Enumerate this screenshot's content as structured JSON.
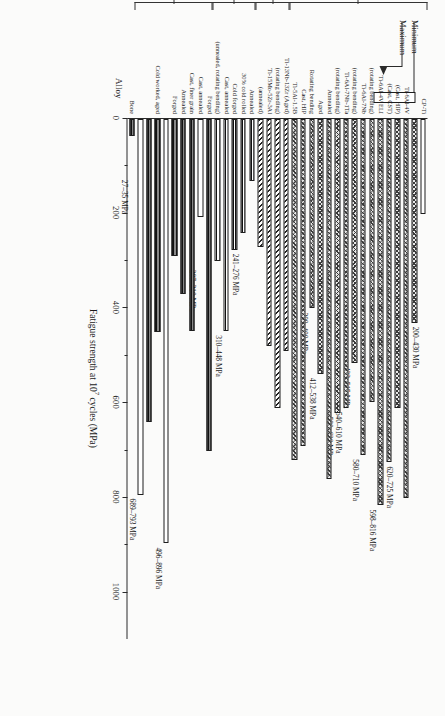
{
  "figure": {
    "axis_title_x": "Fatigue strength at 10",
    "axis_title_x_sup": "7",
    "axis_title_x_tail": " cycles (MPa)",
    "axis_title_y": "Alloy",
    "x_ticks": [
      "0",
      "200",
      "400",
      "600",
      "800",
      "1000"
    ],
    "xlim_max": 1100
  },
  "legend": {
    "minimum_label": "Minimum",
    "maximum_label": "Maximum"
  },
  "families": [
    {
      "label": "α + β",
      "first": 0,
      "last": 13
    },
    {
      "label": "β",
      "first": 14,
      "last": 17
    },
    {
      "label": "Stainless steel",
      "first": 18,
      "last": 22
    },
    {
      "label": "Co type alloy",
      "first": 23,
      "last": 28
    }
  ],
  "chart_data": {
    "type": "bar",
    "xlabel": "Fatigue strength at 10^7 cycles (MPa)",
    "ylabel": "Alloy",
    "xlim": [
      0,
      1100
    ],
    "grid": false,
    "legend": [
      "Minimum",
      "Maximum"
    ],
    "note": "Each alloy shows a Minimum bar (open/white) and a Maximum bar (hatched); single bars where only one value is reported.",
    "categories": [
      "CP-Ti",
      "Ti-6Al-4V",
      "(Cast, HIP)",
      "(Cast, CST)",
      "Ti-6Al-4V ELI",
      "(rotating bending)",
      "Ti-6Al-7Nb",
      "(rotating bending)",
      "Ti-6Al-7Nb-1Ta",
      "(rotating bending)",
      "Annealed",
      "Aged",
      "Rotating bending",
      "Cast, HIP",
      "Ti-5Al-1.5B",
      "Ti-13Nb-13Zr (Aged)",
      "TMZF(Ti-12Mo-6Zr-2Fe) (annealed, rotating bending)",
      "Ti-15Mo-5Zr-3Al",
      "Ti-35.3Nb-5.1Ta-7.1Zr (annealed)",
      "Annealed",
      "30% cold rolled",
      "Cold forged",
      "Cast, annealed",
      "(unnealed, rotating bending)",
      "Forged",
      "Cast, annealed",
      "Cast, finer grain",
      "Annealed",
      "Forged",
      "Cold worked, aged",
      "Bone"
    ],
    "series": [
      {
        "name": "Minimum",
        "values": [
          200,
          620,
          650,
          320,
          598,
          423,
          580,
          540,
          580,
          560,
          412,
          300,
          640,
          null,
          620,
          430,
          480,
          265,
          210,
          80,
          241,
          310,
          200,
          680,
          null,
          207,
          450,
          330,
          290,
          450,
          27
        ]
      },
      {
        "name": "Maximum",
        "values": [
          430,
          725,
          null,
          null,
          816,
          515,
          710,
          610,
          620,
          null,
          538,
          400,
          null,
          null,
          null,
          null,
          null,
          null,
          null,
          null,
          276,
          448,
          null,
          null,
          null,
          310,
          null,
          null,
          null,
          689,
          35
        ]
      }
    ],
    "annotations": [
      {
        "bar": "CP-Ti",
        "text": "200–430 MPa"
      },
      {
        "bar": "Ti-6Al-4V",
        "text": "620–725 MPa"
      },
      {
        "bar": "Ti-6Al-4V ELI",
        "text": "598–816 MPa"
      },
      {
        "bar": "Ti-6Al-7Nb",
        "text": "580–710 MPa"
      },
      {
        "bar": "Ti-6Al-4V (rotating bending)",
        "text": "423–515 MPa"
      },
      {
        "bar": "Ti-6Al-7Nb (rotating bending)",
        "text": "540–610 MPa"
      },
      {
        "bar": "Ti-6Al-7Nb-1Ta",
        "text": "580–620 MPa"
      },
      {
        "bar": "Annealed",
        "text": "412–538 MPa"
      },
      {
        "bar": "Aged",
        "text": "300–400 MPa"
      },
      {
        "bar": "AISI 316 LVM",
        "text": "241–276 MPa"
      },
      {
        "bar": "SUS 316 L",
        "text": "310–448 MPa"
      },
      {
        "bar": "Co-Cr-Mo forged",
        "text": "207–310 MPa"
      },
      {
        "bar": "Co-Cr-Mo cast annealed",
        "text": "496–896 MPa"
      },
      {
        "bar": "Co-Ni-Cr-Mo cold worked aged",
        "text": "689–793 MPa"
      },
      {
        "bar": "Bone",
        "text": "27–35 MPa"
      }
    ]
  },
  "bars": [
    {
      "name": "cp-ti-min",
      "label": "CP-Ti",
      "v": 200,
      "hatch": "h-open",
      "ann": "200–430 MPa",
      "ann_at": 430
    },
    {
      "name": "cp-ti-max",
      "label": "",
      "v": 430,
      "hatch": "h-cross"
    },
    {
      "name": "ti6al4v",
      "label": "Ti-6Al-4V",
      "v": 800,
      "hatch": "h-cross"
    },
    {
      "name": "cast-hip",
      "label": "(Cast, HIP)",
      "v": 610,
      "hatch": "h-cross",
      "ann": "620–725 MPa",
      "ann_at": 725
    },
    {
      "name": "cast-cst",
      "label": "(Cast, CST)",
      "v": 725,
      "hatch": "h-cross"
    },
    {
      "name": "ti6al4v-eli",
      "label": "Ti-6Al-4V ELI",
      "v": 816,
      "hatch": "h-cross",
      "ann": "598–816 MPa",
      "ann_at": 816
    },
    {
      "name": "rot-bending-1",
      "label": "(rotating bending)",
      "v": 598,
      "hatch": "h-cross"
    },
    {
      "name": "ti6al7nb",
      "label": "Ti-6Al-7Nb",
      "v": 710,
      "hatch": "h-cross",
      "ann": "580–710 MPa",
      "ann_at": 710
    },
    {
      "name": "rot-bending-2",
      "label": "(rotating bending)",
      "v": 515,
      "hatch": "h-cross",
      "ann": "423–515 MPa",
      "ann_at": 515
    },
    {
      "name": "ti6al7nb-1ta",
      "label": "Ti-6Al-7Nb-1Ta",
      "v": 610,
      "hatch": "h-cross",
      "ann": "540–610 MPa",
      "ann_at": 610
    },
    {
      "name": "rot-bending-3",
      "label": "(rotating bending)",
      "v": 620,
      "hatch": "h-cross",
      "ann": "580–620 MPa",
      "ann_at": 620
    },
    {
      "name": "annealed-1",
      "label": "Annealed",
      "v": 760,
      "hatch": "h-cross"
    },
    {
      "name": "aged-1",
      "label": "Aged",
      "v": 538,
      "hatch": "h-cross",
      "ann": "412–538 MPa",
      "ann_at": 538
    },
    {
      "name": "rot-bending-4",
      "label": "Rotating bending",
      "v": 400,
      "hatch": "h-cross",
      "ann": "300–400 MPa",
      "ann_at": 400
    },
    {
      "name": "cast-hip-2",
      "label": "Cast, HIP",
      "v": 690,
      "hatch": "h-cross"
    },
    {
      "name": "ti5al15b",
      "label": "Ti-5Al-1.5B",
      "v": 720,
      "hatch": "h-cross"
    },
    {
      "name": "ti13nb13zr",
      "label": "Ti-13Nb-13Zr (Aged)",
      "v": 490,
      "hatch": "h-diag"
    },
    {
      "name": "tmzf",
      "label": "(rotating bending)",
      "v": 610,
      "hatch": "h-diag"
    },
    {
      "name": "ti15mo5zr3al",
      "label": "Ti-15Mo-5Zr-3Al",
      "v": 480,
      "hatch": "h-diag"
    },
    {
      "name": "ti353nb",
      "label": "(annealed)",
      "v": 270,
      "hatch": "h-diag"
    },
    {
      "name": "ss-annealed",
      "label": "Annealed",
      "v": 130,
      "hatch": "h-horz"
    },
    {
      "name": "ss-cold-rolled",
      "label": "30% cold rolled",
      "v": 241,
      "hatch": "h-horz",
      "ann": "241–276 MPa",
      "ann_at": 276
    },
    {
      "name": "ss-cold-forged",
      "label": "Cold forged",
      "v": 276,
      "hatch": "h-horz"
    },
    {
      "name": "ss-cast-annealed",
      "label": "Cast, annealed",
      "v": 448,
      "hatch": "h-horz",
      "ann": "310–448 MPa",
      "ann_at": 448
    },
    {
      "name": "ss-rot-bending",
      "label": "(unnealed, rotating bending)",
      "v": 300,
      "hatch": "h-horz"
    },
    {
      "name": "co-forged",
      "label": "Forged",
      "v": 700,
      "hatch": "h-dots"
    },
    {
      "name": "co-cast-annealed",
      "label": "Cast, annealed",
      "v": 207,
      "hatch": "h-open",
      "ann": "207–310 MPa",
      "ann_at": 310
    },
    {
      "name": "co-cast-finer-grain",
      "label": "Cast, finer grain",
      "v": 448,
      "hatch": "h-dots"
    },
    {
      "name": "co-annealed",
      "label": "Annealed",
      "v": 370,
      "hatch": "h-dots"
    },
    {
      "name": "co-forged-2",
      "label": "Forged",
      "v": 290,
      "hatch": "h-dots"
    },
    {
      "name": "co-cw-aged-open",
      "label": "",
      "v": 896,
      "hatch": "h-open",
      "ann": "496–896 MPa",
      "ann_at": 896
    },
    {
      "name": "co-cw-aged",
      "label": "Cold worked, aged",
      "v": 450,
      "hatch": "h-dots"
    },
    {
      "name": "co-cw-aged-2",
      "label": "",
      "v": 640,
      "hatch": "h-dots"
    },
    {
      "name": "co-ni-cr-mo-open",
      "label": "",
      "v": 793,
      "hatch": "h-open",
      "ann": "689–793 MPa",
      "ann_at": 793
    },
    {
      "name": "bone",
      "label": "Bone",
      "v": 35,
      "hatch": "h-dots",
      "ann": "27–35 MPa",
      "ann_at": 120
    }
  ]
}
